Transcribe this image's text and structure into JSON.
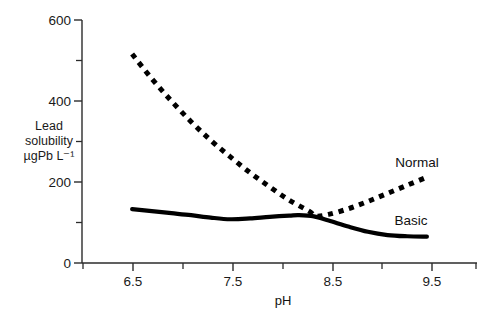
{
  "chart_data": {
    "type": "line",
    "title": "",
    "xlabel": "pH",
    "ylabel_lines": [
      "Lead",
      "solubility",
      "µgPb L⁻¹"
    ],
    "ylabel": "Lead solubility µgPb L⁻¹",
    "xlim": [
      6.0,
      10.0
    ],
    "ylim": [
      0,
      600
    ],
    "x_major_ticks": [
      6.5,
      7.5,
      8.5,
      9.5
    ],
    "x_major_tick_labels": [
      "6.5",
      "7.5",
      "8.5",
      "9.5"
    ],
    "x_minor_ticks": [
      6.0,
      7.0,
      8.0,
      9.0,
      10.0
    ],
    "y_major_ticks": [
      0,
      200,
      400,
      600
    ],
    "y_major_tick_labels": [
      "0",
      "200",
      "400",
      "600"
    ],
    "y_minor_ticks": [
      100,
      300,
      500
    ],
    "grid": false,
    "legend_position": "inline-annotations",
    "series": [
      {
        "name": "Normal",
        "style": "dotted",
        "color": "#000000",
        "label_text": "Normal",
        "x": [
          6.5,
          6.7,
          6.9,
          7.1,
          7.3,
          7.5,
          7.7,
          7.9,
          8.1,
          8.3,
          8.37,
          8.5,
          8.7,
          8.9,
          9.1,
          9.3,
          9.5
        ],
        "values": [
          516,
          455,
          400,
          349,
          303,
          262,
          223,
          188,
          155,
          128,
          116,
          120,
          134,
          152,
          172,
          192,
          212
        ]
      },
      {
        "name": "Basic",
        "style": "solid",
        "color": "#000000",
        "label_text": "Basic",
        "x": [
          6.5,
          6.7,
          6.9,
          7.1,
          7.3,
          7.5,
          7.7,
          7.9,
          8.1,
          8.2,
          8.35,
          8.5,
          8.7,
          8.9,
          9.1,
          9.3,
          9.5
        ],
        "values": [
          133,
          128,
          123,
          118,
          112,
          108,
          110,
          114,
          117,
          118,
          115,
          105,
          90,
          77,
          69,
          66,
          65
        ]
      }
    ],
    "annotations": [
      {
        "text": "Normal",
        "x": 9.35,
        "y": 250
      },
      {
        "text": "Basic",
        "x": 9.25,
        "y": 105
      }
    ]
  },
  "colors": {
    "background": "#ffffff",
    "axis": "#2b2b2b",
    "ink": "#000000"
  }
}
